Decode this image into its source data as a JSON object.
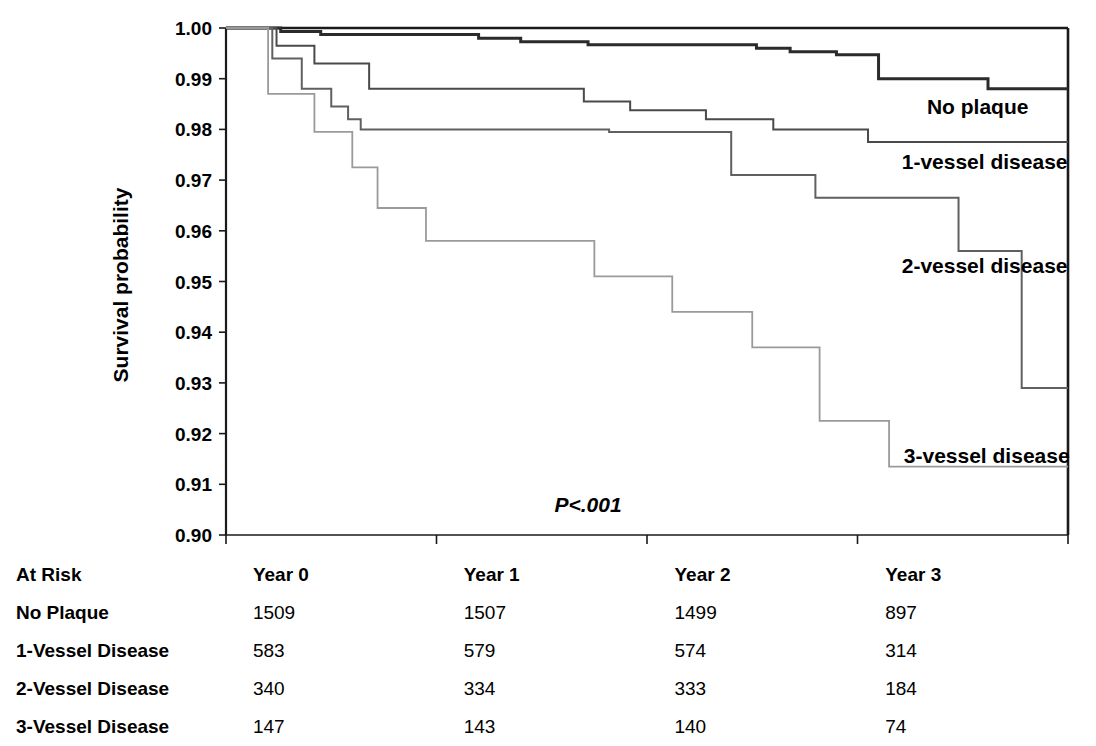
{
  "chart_data": {
    "type": "line",
    "subtype": "kaplan-meier-step",
    "title": "",
    "xlabel": "",
    "ylabel": "Survival probability",
    "ylim": [
      0.9,
      1.0
    ],
    "xlim": [
      0,
      4
    ],
    "ytick_labels": [
      "1.00",
      "0.99",
      "0.98",
      "0.97",
      "0.96",
      "0.95",
      "0.94",
      "0.93",
      "0.92",
      "0.91",
      "0.90"
    ],
    "ytick_values": [
      1.0,
      0.99,
      0.98,
      0.97,
      0.96,
      0.95,
      0.94,
      0.93,
      0.92,
      0.91,
      0.9
    ],
    "xtick_values": [
      0,
      1,
      2,
      3,
      4
    ],
    "xtick_labels": [
      "",
      "",
      "",
      "",
      ""
    ],
    "grid": false,
    "legend_position": "right-inline",
    "annotation": "P<.001",
    "series": [
      {
        "name": "No plaque",
        "color": "#2b2b2b",
        "width": 3.0,
        "label": "No plaque",
        "label_x": 3.33,
        "label_y": 0.9845,
        "points": [
          [
            0.0,
            1.0
          ],
          [
            0.26,
            1.0
          ],
          [
            0.26,
            0.9993
          ],
          [
            0.45,
            0.9993
          ],
          [
            0.45,
            0.9987
          ],
          [
            1.2,
            0.9987
          ],
          [
            1.2,
            0.998
          ],
          [
            1.4,
            0.998
          ],
          [
            1.4,
            0.9973
          ],
          [
            1.72,
            0.9973
          ],
          [
            1.72,
            0.9967
          ],
          [
            2.52,
            0.9967
          ],
          [
            2.52,
            0.996
          ],
          [
            2.68,
            0.996
          ],
          [
            2.68,
            0.9953
          ],
          [
            2.9,
            0.9953
          ],
          [
            2.9,
            0.9947
          ],
          [
            3.1,
            0.9947
          ],
          [
            3.1,
            0.99
          ],
          [
            3.62,
            0.99
          ],
          [
            3.62,
            0.988
          ],
          [
            4.0,
            0.988
          ]
        ]
      },
      {
        "name": "1-vessel disease",
        "color": "#4a4a4a",
        "width": 2.0,
        "label": "1-vessel disease",
        "label_x": 3.21,
        "label_y": 0.9735,
        "points": [
          [
            0.0,
            1.0
          ],
          [
            0.24,
            1.0
          ],
          [
            0.24,
            0.9965
          ],
          [
            0.42,
            0.9965
          ],
          [
            0.42,
            0.993
          ],
          [
            0.68,
            0.993
          ],
          [
            0.68,
            0.988
          ],
          [
            1.7,
            0.988
          ],
          [
            1.7,
            0.9855
          ],
          [
            1.92,
            0.9855
          ],
          [
            1.92,
            0.9838
          ],
          [
            2.28,
            0.9838
          ],
          [
            2.28,
            0.982
          ],
          [
            2.6,
            0.982
          ],
          [
            2.6,
            0.98
          ],
          [
            3.05,
            0.98
          ],
          [
            3.05,
            0.9775
          ],
          [
            4.0,
            0.9775
          ]
        ]
      },
      {
        "name": "2-vessel disease",
        "color": "#606060",
        "width": 2.0,
        "label": "2-vessel disease",
        "label_x": 3.21,
        "label_y": 0.953,
        "points": [
          [
            0.0,
            1.0
          ],
          [
            0.22,
            1.0
          ],
          [
            0.22,
            0.994
          ],
          [
            0.36,
            0.994
          ],
          [
            0.36,
            0.988
          ],
          [
            0.5,
            0.988
          ],
          [
            0.5,
            0.9845
          ],
          [
            0.58,
            0.9845
          ],
          [
            0.58,
            0.982
          ],
          [
            0.64,
            0.982
          ],
          [
            0.64,
            0.98
          ],
          [
            1.82,
            0.98
          ],
          [
            1.82,
            0.9795
          ],
          [
            2.4,
            0.9795
          ],
          [
            2.4,
            0.971
          ],
          [
            2.8,
            0.971
          ],
          [
            2.8,
            0.9665
          ],
          [
            3.48,
            0.9665
          ],
          [
            3.48,
            0.956
          ],
          [
            3.78,
            0.956
          ],
          [
            3.78,
            0.929
          ],
          [
            4.0,
            0.929
          ]
        ]
      },
      {
        "name": "3-vessel disease",
        "color": "#9a9a9a",
        "width": 1.8,
        "label": "3-vessel disease",
        "label_x": 3.22,
        "label_y": 0.9155,
        "points": [
          [
            0.0,
            1.0
          ],
          [
            0.2,
            1.0
          ],
          [
            0.2,
            0.987
          ],
          [
            0.42,
            0.987
          ],
          [
            0.42,
            0.9795
          ],
          [
            0.6,
            0.9795
          ],
          [
            0.6,
            0.9725
          ],
          [
            0.72,
            0.9725
          ],
          [
            0.72,
            0.9645
          ],
          [
            0.95,
            0.9645
          ],
          [
            0.95,
            0.958
          ],
          [
            1.75,
            0.958
          ],
          [
            1.75,
            0.951
          ],
          [
            2.12,
            0.951
          ],
          [
            2.12,
            0.944
          ],
          [
            2.5,
            0.944
          ],
          [
            2.5,
            0.937
          ],
          [
            2.82,
            0.937
          ],
          [
            2.82,
            0.9225
          ],
          [
            3.15,
            0.9225
          ],
          [
            3.15,
            0.9135
          ],
          [
            4.0,
            0.9135
          ]
        ]
      }
    ]
  },
  "risk_table": {
    "corner_label": "At Risk",
    "columns": [
      "Year 0",
      "Year 1",
      "Year 2",
      "Year 3"
    ],
    "rows": [
      {
        "label": "No Plaque",
        "values": [
          "1509",
          "1507",
          "1499",
          "897"
        ]
      },
      {
        "label": "1-Vessel Disease",
        "values": [
          "583",
          "579",
          "574",
          "314"
        ]
      },
      {
        "label": "2-Vessel Disease",
        "values": [
          "340",
          "334",
          "333",
          "184"
        ]
      },
      {
        "label": "3-Vessel Disease",
        "values": [
          "147",
          "143",
          "140",
          "74"
        ]
      }
    ]
  }
}
